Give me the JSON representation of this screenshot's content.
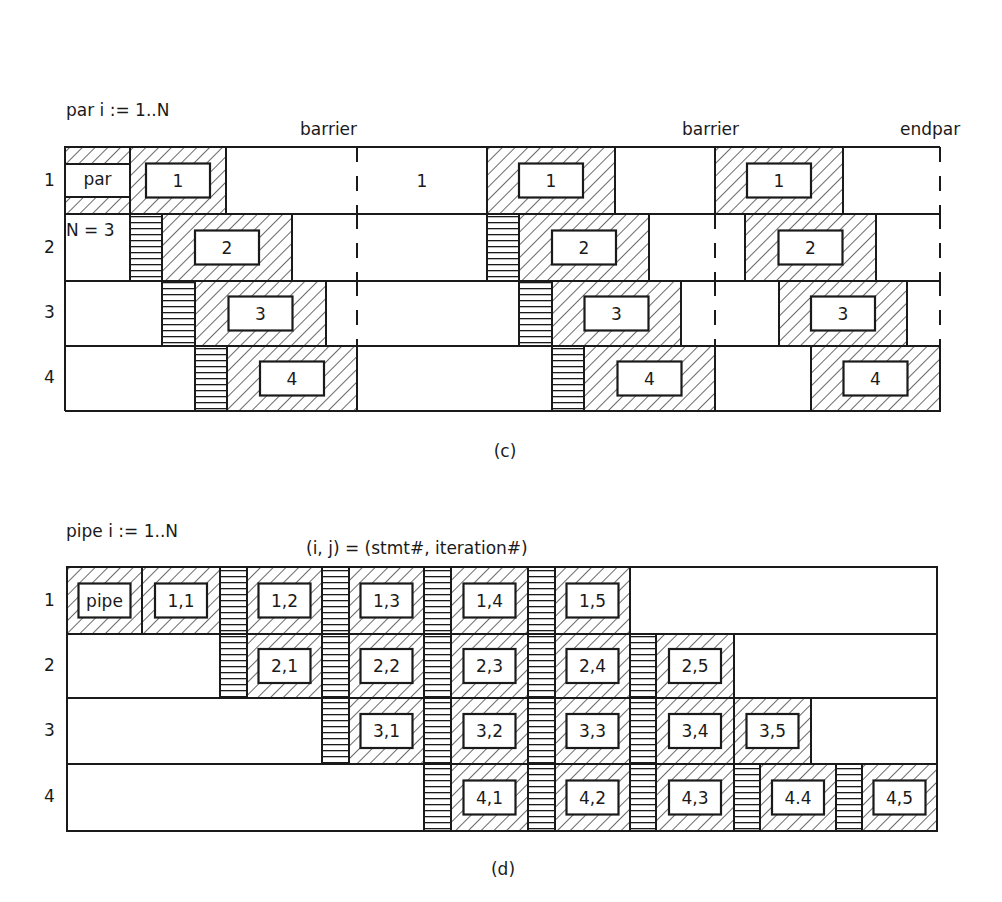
{
  "colors": {
    "ink": "#1a1a1a",
    "paper": "#ffffff"
  },
  "figure_c": {
    "header": [
      "par i := 1..N",
      "K = 3",
      "N = 3"
    ],
    "caption": "(c)",
    "annotations": [
      {
        "text": "barrier",
        "x": 300,
        "y": 123
      },
      {
        "text": "barrier",
        "x": 682,
        "y": 123
      },
      {
        "text": "endpar",
        "x": 900,
        "y": 123
      }
    ],
    "row_labels": [
      "1",
      "2",
      "3",
      "4"
    ],
    "frame": {
      "left": 65,
      "right": 940
    },
    "rows": [
      {
        "top": 147,
        "bottom": 214
      },
      {
        "top": 214,
        "bottom": 281
      },
      {
        "top": 281,
        "bottom": 346
      },
      {
        "top": 346,
        "bottom": 411
      }
    ],
    "par_cell": {
      "x0": 65,
      "x1": 130,
      "inner_top": 164,
      "inner_bottom": 197,
      "label": "par"
    },
    "stmt_blocks": [
      {
        "row": 0,
        "x0": 130,
        "x1": 226,
        "label": "1"
      },
      {
        "row": 1,
        "x0": 162,
        "x1": 292,
        "label": "2"
      },
      {
        "row": 2,
        "x0": 195,
        "x1": 326,
        "label": "3"
      },
      {
        "row": 3,
        "x0": 227,
        "x1": 357,
        "label": "4"
      },
      {
        "row": 0,
        "x0": 487,
        "x1": 615,
        "label": "1"
      },
      {
        "row": 1,
        "x0": 519,
        "x1": 649,
        "label": "2"
      },
      {
        "row": 2,
        "x0": 552,
        "x1": 681,
        "label": "3"
      },
      {
        "row": 3,
        "x0": 584,
        "x1": 715,
        "label": "4"
      },
      {
        "row": 0,
        "x0": 715,
        "x1": 843,
        "label": "1"
      },
      {
        "row": 1,
        "x0": 745,
        "x1": 876,
        "label": "2"
      },
      {
        "row": 2,
        "x0": 779,
        "x1": 907,
        "label": "3"
      },
      {
        "row": 3,
        "x0": 811,
        "x1": 940,
        "label": "4"
      }
    ],
    "sync_stripes": [
      {
        "row": 1,
        "x0": 130,
        "x1": 162
      },
      {
        "row": 2,
        "x0": 162,
        "x1": 195
      },
      {
        "row": 3,
        "x0": 195,
        "x1": 227
      },
      {
        "row": 1,
        "x0": 487,
        "x1": 519
      },
      {
        "row": 2,
        "x0": 519,
        "x1": 552
      },
      {
        "row": 3,
        "x0": 552,
        "x1": 584
      }
    ],
    "idle_labels": [
      {
        "row": 0,
        "x": 422,
        "text": "1"
      }
    ],
    "solid_dividers": [
      {
        "row": 0,
        "x": 226
      },
      {
        "row": 1,
        "x": 292
      },
      {
        "row": 2,
        "x": 326
      },
      {
        "row": 3,
        "x": 357
      },
      {
        "row": 0,
        "x": 487
      },
      {
        "row": 1,
        "x": 649
      },
      {
        "row": 2,
        "x": 681
      },
      {
        "row": 0,
        "x": 615
      },
      {
        "row": 1,
        "x": 876
      },
      {
        "row": 2,
        "x": 907
      },
      {
        "row": 3,
        "x": 715
      }
    ],
    "dashed_barriers": [
      {
        "x": 357,
        "rows": [
          0,
          1,
          2
        ]
      },
      {
        "x": 715,
        "rows": [
          1,
          2
        ]
      },
      {
        "x": 940,
        "rows": [
          0,
          1,
          2
        ]
      }
    ]
  },
  "figure_d": {
    "header": [
      "pipe i := 1..N",
      "K = 4",
      "N = 5"
    ],
    "legend": "(i, j) = (stmt#, iteration#)",
    "caption": "(d)",
    "row_labels": [
      "1",
      "2",
      "3",
      "4"
    ],
    "frame": {
      "left": 67,
      "right": 937
    },
    "rows": [
      {
        "top": 567,
        "bottom": 634
      },
      {
        "top": 634,
        "bottom": 698
      },
      {
        "top": 698,
        "bottom": 764
      },
      {
        "top": 764,
        "bottom": 831
      }
    ],
    "cells": [
      {
        "row": 0,
        "x0": 67,
        "x1": 142,
        "label": "pipe"
      },
      {
        "row": 0,
        "x0": 142,
        "x1": 220,
        "label": "1,1"
      },
      {
        "row": 0,
        "x0": 247,
        "x1": 322,
        "label": "1,2"
      },
      {
        "row": 0,
        "x0": 349,
        "x1": 424,
        "label": "1,3"
      },
      {
        "row": 0,
        "x0": 451,
        "x1": 528,
        "label": "1,4"
      },
      {
        "row": 0,
        "x0": 555,
        "x1": 630,
        "label": "1,5"
      },
      {
        "row": 1,
        "x0": 247,
        "x1": 322,
        "label": "2,1"
      },
      {
        "row": 1,
        "x0": 349,
        "x1": 424,
        "label": "2,2"
      },
      {
        "row": 1,
        "x0": 451,
        "x1": 528,
        "label": "2,3"
      },
      {
        "row": 1,
        "x0": 555,
        "x1": 630,
        "label": "2,4"
      },
      {
        "row": 1,
        "x0": 656,
        "x1": 734,
        "label": "2,5"
      },
      {
        "row": 2,
        "x0": 349,
        "x1": 424,
        "label": "3,1"
      },
      {
        "row": 2,
        "x0": 451,
        "x1": 528,
        "label": "3,2"
      },
      {
        "row": 2,
        "x0": 555,
        "x1": 630,
        "label": "3,3"
      },
      {
        "row": 2,
        "x0": 656,
        "x1": 734,
        "label": "3,4"
      },
      {
        "row": 2,
        "x0": 734,
        "x1": 811,
        "label": "3,5"
      },
      {
        "row": 3,
        "x0": 451,
        "x1": 528,
        "label": "4,1"
      },
      {
        "row": 3,
        "x0": 555,
        "x1": 630,
        "label": "4,2"
      },
      {
        "row": 3,
        "x0": 656,
        "x1": 734,
        "label": "4,3"
      },
      {
        "row": 3,
        "x0": 760,
        "x1": 836,
        "label": "4.4"
      },
      {
        "row": 3,
        "x0": 862,
        "x1": 937,
        "label": "4,5"
      }
    ],
    "sync_stripes": [
      {
        "row": 0,
        "x0": 220,
        "x1": 247
      },
      {
        "row": 1,
        "x0": 220,
        "x1": 247
      },
      {
        "row": 0,
        "x0": 322,
        "x1": 349
      },
      {
        "row": 1,
        "x0": 322,
        "x1": 349
      },
      {
        "row": 2,
        "x0": 322,
        "x1": 349
      },
      {
        "row": 0,
        "x0": 424,
        "x1": 451
      },
      {
        "row": 1,
        "x0": 424,
        "x1": 451
      },
      {
        "row": 2,
        "x0": 424,
        "x1": 451
      },
      {
        "row": 3,
        "x0": 424,
        "x1": 451
      },
      {
        "row": 0,
        "x0": 528,
        "x1": 555
      },
      {
        "row": 1,
        "x0": 528,
        "x1": 555
      },
      {
        "row": 2,
        "x0": 528,
        "x1": 555
      },
      {
        "row": 3,
        "x0": 528,
        "x1": 555
      },
      {
        "row": 1,
        "x0": 630,
        "x1": 656
      },
      {
        "row": 2,
        "x0": 630,
        "x1": 656
      },
      {
        "row": 3,
        "x0": 630,
        "x1": 656
      },
      {
        "row": 3,
        "x0": 734,
        "x1": 760
      },
      {
        "row": 3,
        "x0": 836,
        "x1": 862
      }
    ]
  }
}
